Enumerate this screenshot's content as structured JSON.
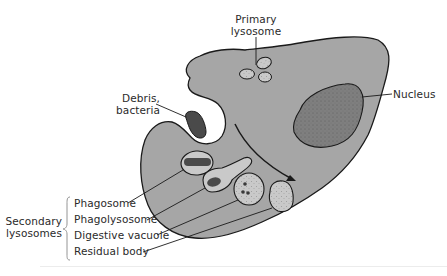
{
  "diagram": {
    "type": "biological-cell-diagram",
    "colors": {
      "background": "#ffffff",
      "cytoplasm": "#a6a6a6",
      "outline": "#1a1a1a",
      "nucleus": "#7f7f7f",
      "vesicle_light": "#c9c9c9",
      "debris": "#4a4a4a",
      "pocket": "#ffffff",
      "text": "#2a2a2a"
    },
    "labels": {
      "primary_lysosome": [
        "Primary",
        "lysosome"
      ],
      "debris": [
        "Debris,",
        "bacteria"
      ],
      "nucleus": "Nucleus",
      "secondary_lysosomes": [
        "Secondary",
        "lysosomes"
      ],
      "phagosome": "Phagosome",
      "phagolysosome": "Phagolysosome",
      "digestive_vacuole": "Digestive vacuole",
      "residual_body": "Residual body"
    }
  }
}
